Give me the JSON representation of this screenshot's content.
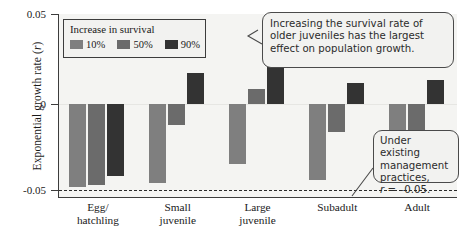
{
  "chart_data": {
    "type": "bar",
    "title": "",
    "xlabel": "",
    "ylabel": "Exponential growth rate (r)",
    "ylim": [
      -0.05,
      0.05
    ],
    "yticks": [
      0.05,
      0,
      -0.05
    ],
    "ytick_labels": [
      "0.05",
      "0",
      "-0.05"
    ],
    "grid": false,
    "legend_position": "top-left",
    "legend_title": "Increase in survival",
    "categories": [
      "Egg/ hatchling",
      "Small juvenile",
      "Large juvenile",
      "Subadult",
      "Adult"
    ],
    "series": [
      {
        "name": "10%",
        "color": "#7f7f7f",
        "values": [
          -0.048,
          -0.046,
          -0.035,
          -0.044,
          -0.043
        ]
      },
      {
        "name": "50%",
        "color": "#6b6b6b",
        "values": [
          -0.047,
          -0.012,
          0.009,
          -0.016,
          -0.026
        ]
      },
      {
        "name": "90%",
        "color": "#333333",
        "values": [
          -0.042,
          0.018,
          0.049,
          0.012,
          0.014
        ]
      }
    ],
    "reference_line": {
      "value": -0.05,
      "style": "dashed",
      "label": "r = -0.05"
    },
    "annotations": [
      "Increasing the survival rate of older juveniles has the largest effect on population growth.",
      "Under existing management practices, r = -0.05."
    ]
  },
  "axis": {
    "y_title_main": "Exponential growth rate (",
    "y_title_italic": "r",
    "y_title_end": ")",
    "tick_top": "0.05",
    "tick_mid": "0",
    "tick_bottom": "-0.05"
  },
  "legend": {
    "title": "Increase in survival",
    "entries": [
      {
        "label": "10%",
        "color": "#7f7f7f"
      },
      {
        "label": "50%",
        "color": "#6b6b6b"
      },
      {
        "label": "90%",
        "color": "#333333"
      }
    ]
  },
  "callouts": {
    "top": "Increasing the survival rate of older juveniles has the largest effect on population growth.",
    "bottom_line1": "Under existing",
    "bottom_line2": "management",
    "bottom_line3": "practices,",
    "bottom_italic": "r",
    "bottom_line4": " = –0.05."
  },
  "categories": [
    {
      "line1": "Egg/",
      "line2": "hatchling"
    },
    {
      "line1": "Small",
      "line2": "juvenile"
    },
    {
      "line1": "Large",
      "line2": "juvenile"
    },
    {
      "line1": "Subadult",
      "line2": ""
    },
    {
      "line1": "Adult",
      "line2": ""
    }
  ]
}
